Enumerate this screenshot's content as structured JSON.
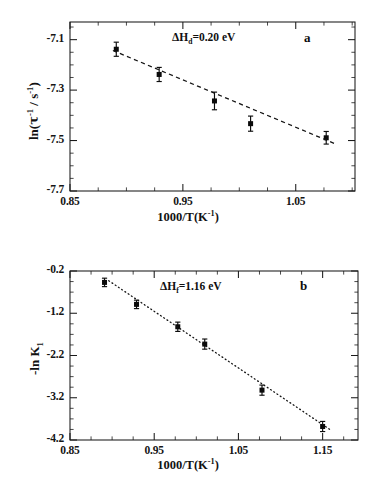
{
  "figure": {
    "panel_a_tag": "a",
    "panel_b_tag": "b"
  },
  "panel_a": {
    "ylabel_pre": "ln(",
    "ylabel_tau": "τ",
    "ylabel_sup1": "-1",
    "ylabel_mid": " / s",
    "ylabel_sup2": "-1",
    "ylabel_post": ")",
    "xlabel_main": "1000/T(K",
    "xlabel_sup": "-1",
    "xlabel_close": ")",
    "annotation_delta": "ΔH",
    "annotation_sub": "d",
    "annotation_rest": "=0.20  eV",
    "ytick_labels": [
      "-7.1",
      "-7.3",
      "-7.5",
      "-7.7"
    ],
    "xtick_labels": [
      "0.85",
      "0.95",
      "1.05"
    ]
  },
  "panel_b": {
    "ylabel_pre": "-ln K",
    "ylabel_sub": "1",
    "xlabel_main": "1000/T(K",
    "xlabel_sup": "-1",
    "xlabel_close": ")",
    "annotation_delta": "ΔH",
    "annotation_sub": "f",
    "annotation_rest": "=1.16  eV",
    "ytick_labels": [
      "-0.2",
      "-1.2",
      "-2.2",
      "-3.2",
      "-4.2"
    ],
    "xtick_labels": [
      "0.85",
      "0.95",
      "1.05",
      "1.15"
    ]
  },
  "chart_data": [
    {
      "type": "scatter",
      "panel": "a",
      "title": "",
      "xlabel": "1000/T(K^-1)",
      "ylabel": "ln(tau^-1 / s^-1)",
      "xlim": [
        0.85,
        1.1025
      ],
      "ylim": [
        -7.7,
        -7.03
      ],
      "xticks_major": [
        0.85,
        0.95,
        1.05
      ],
      "xticks_minor_step": 0.025,
      "yticks_major": [
        -7.1,
        -7.3,
        -7.5,
        -7.7
      ],
      "yticks_minor_step": 0.05,
      "grid": false,
      "legend": null,
      "annotations": [
        {
          "text": "ΔHd=0.20  eV",
          "x": 0.975,
          "y": -7.055
        },
        {
          "text": "a",
          "x": 1.092,
          "y": -7.06
        }
      ],
      "series": [
        {
          "name": "ln(tau^-1)",
          "marker": "filled-square",
          "x": [
            0.891,
            0.929,
            0.978,
            1.01,
            1.077
          ],
          "y": [
            -7.138,
            -7.238,
            -7.343,
            -7.433,
            -7.489
          ],
          "yerr": [
            0.028,
            0.028,
            0.035,
            0.03,
            0.025
          ]
        },
        {
          "name": "linear fit (dashed)",
          "type": "line",
          "style": "dashed",
          "x": [
            0.888,
            1.085
          ],
          "y": [
            -7.143,
            -7.513
          ]
        }
      ]
    },
    {
      "type": "scatter",
      "panel": "b",
      "title": "",
      "xlabel": "1000/T(K^-1)",
      "ylabel": "-ln K1",
      "xlim": [
        0.85,
        1.192
      ],
      "ylim": [
        -4.2,
        -0.2
      ],
      "xticks_major": [
        0.85,
        0.95,
        1.05,
        1.15
      ],
      "xticks_minor_step": 0.025,
      "yticks_major": [
        -0.2,
        -1.2,
        -2.2,
        -3.2,
        -4.2
      ],
      "yticks_minor_step": 0.25,
      "grid": false,
      "legend": null,
      "annotations": [
        {
          "text": "ΔHf=1.16  eV",
          "x": 0.995,
          "y": -0.56
        },
        {
          "text": "b",
          "x": 1.152,
          "y": -0.53
        }
      ],
      "series": [
        {
          "name": "-ln K1",
          "marker": "filled-square",
          "x": [
            0.891,
            0.929,
            0.978,
            1.01,
            1.078,
            1.15
          ],
          "y": [
            -0.47,
            -0.99,
            -1.52,
            -1.93,
            -3.02,
            -3.88
          ],
          "yerr": [
            0.1,
            0.1,
            0.11,
            0.12,
            0.12,
            0.12
          ]
        },
        {
          "name": "linear fit (dotted)",
          "type": "line",
          "style": "dotted",
          "x": [
            0.896,
            1.16
          ],
          "y": [
            -0.43,
            -3.97
          ]
        }
      ]
    }
  ]
}
